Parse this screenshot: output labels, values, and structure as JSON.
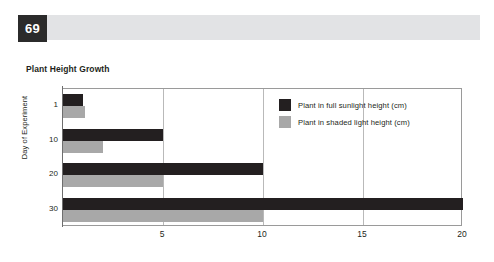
{
  "header": {
    "page_number": "69",
    "banner_color": "#e2e3e5",
    "page_number_box_color": "#2b2b2b"
  },
  "chart_data": {
    "type": "bar",
    "orientation": "horizontal",
    "title": "Plant Height Growth",
    "xlabel": "",
    "ylabel": "Day of Experiment",
    "categories": [
      "1",
      "10",
      "20",
      "30"
    ],
    "series": [
      {
        "name": "Plant in full sunlight height (cm)",
        "color": "#231f20",
        "values": [
          1,
          5,
          10,
          20
        ]
      },
      {
        "name": "Plant in shaded light height (cm)",
        "color": "#a8a8a8",
        "values": [
          1.1,
          2,
          5,
          10
        ]
      }
    ],
    "xlim": [
      0,
      20
    ],
    "xticks": [
      "5",
      "10",
      "15",
      "20"
    ],
    "xtick_values": [
      5,
      10,
      15,
      20
    ],
    "yticks": [
      "1",
      "10",
      "20",
      "30"
    ],
    "grid": true,
    "legend_position": "inside-top-right"
  }
}
